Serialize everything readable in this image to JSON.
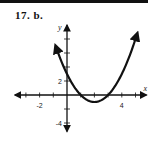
{
  "problem": {
    "label": "17. b."
  },
  "chart_data": {
    "type": "line",
    "title": "",
    "xlabel": "x",
    "ylabel": "y",
    "xlim": [
      -3.8,
      5.8
    ],
    "ylim": [
      -5.2,
      10
    ],
    "x_ticks": [
      -3,
      -2,
      -1,
      1,
      2,
      3,
      4,
      5
    ],
    "y_ticks": [
      -4,
      -2,
      2,
      4,
      6,
      8
    ],
    "x_tick_labels": [
      {
        "value": -2,
        "text": "-2"
      },
      {
        "value": 4,
        "text": "4"
      }
    ],
    "y_tick_labels": [
      {
        "value": 2,
        "text": "2"
      },
      {
        "value": -4,
        "text": "-4"
      }
    ],
    "grid": false,
    "series": [
      {
        "name": "parabola",
        "equation": "y = (x - 2)^2 - 1",
        "vertex": [
          2,
          -1
        ],
        "y_intercept": 3,
        "x_intercepts": [
          1,
          3
        ],
        "x_range": [
          -0.8,
          5.1
        ],
        "arrows_at_ends": true,
        "color": "#111111"
      }
    ]
  }
}
